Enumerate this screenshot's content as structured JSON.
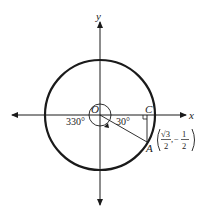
{
  "diagram": {
    "type": "unit-circle",
    "axes": {
      "x_label": "x",
      "y_label": "y"
    },
    "points": {
      "origin": "O",
      "foot": "C",
      "terminal": "A"
    },
    "angles": {
      "reference": "30°",
      "full": "330°"
    },
    "coordinates": {
      "x_num": "√3",
      "x_den": "2",
      "sep": ",",
      "y_sign": "−",
      "y_num": "1",
      "y_den": "2"
    },
    "colors": {
      "stroke": "#1a1a1a",
      "background": "#ffffff"
    }
  }
}
